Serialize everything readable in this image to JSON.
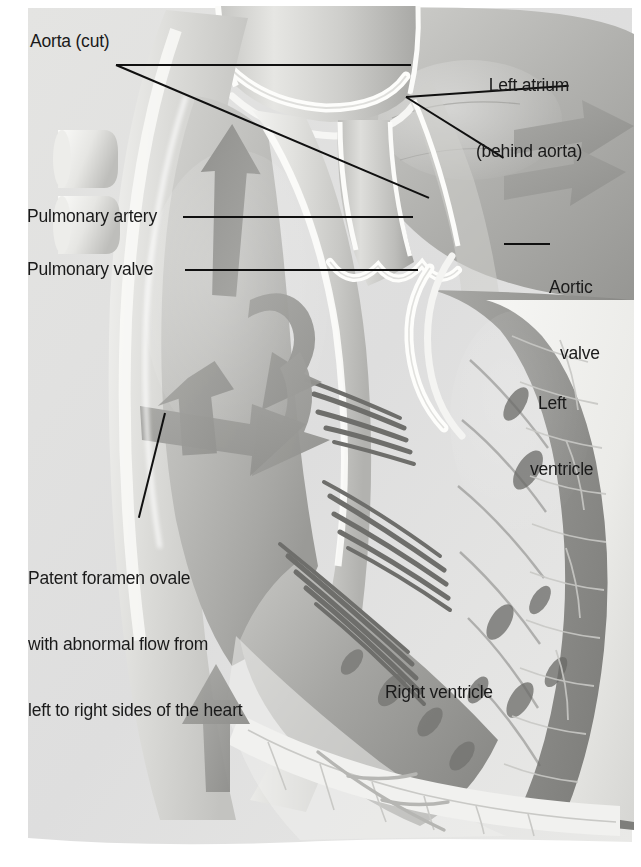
{
  "figure": {
    "type": "anatomical-illustration",
    "background_color": "#ffffff",
    "tissue_light": "#e8e8e6",
    "tissue_mid": "#b9b9b6",
    "tissue_dark": "#8a8a88",
    "arrow_color": "#9a9a98",
    "leader_color": "#101010",
    "label_color": "#1a1a1a"
  },
  "labels": {
    "aorta_cut": "Aorta (cut)",
    "pulmonary_artery": "Pulmonary artery",
    "pulmonary_valve": "Pulmonary valve",
    "left_atrium_line1": "Left atrium",
    "left_atrium_line2": "(behind aorta)",
    "aortic_valve_line1": "Aortic",
    "aortic_valve_line2": "valve",
    "left_ventricle_line1": "Left",
    "left_ventricle_line2": "ventricle",
    "right_ventricle": "Right ventricle",
    "pfo_line1": "Patent foramen ovale",
    "pfo_line2": "with abnormal flow from",
    "pfo_line3": "left to right sides of the heart"
  },
  "flow_arrows": [
    {
      "name": "right-atrium-swirl-upper",
      "direction": "counterclockwise"
    },
    {
      "name": "right-atrium-swirl-lower",
      "direction": "down-left"
    },
    {
      "name": "pfo-shunt-arrow",
      "direction": "left-to-right"
    },
    {
      "name": "inferior-vena-cava-inflow",
      "direction": "upward"
    },
    {
      "name": "aortic-outflow-upper",
      "direction": "right"
    },
    {
      "name": "aortic-outflow-lower",
      "direction": "right"
    }
  ]
}
